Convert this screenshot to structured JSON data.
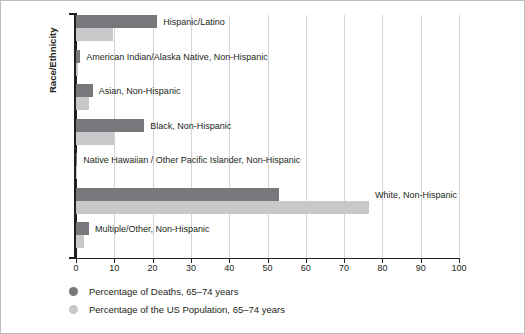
{
  "chart_data": {
    "type": "bar",
    "orientation": "horizontal",
    "title": "",
    "xlabel": "",
    "ylabel": "Race/Ethnicity",
    "xlim": [
      0,
      100
    ],
    "xticks": [
      0,
      10,
      20,
      30,
      40,
      50,
      60,
      70,
      80,
      90,
      100
    ],
    "xtick_labels": [
      "0",
      "10",
      "20",
      "30",
      "40",
      "50",
      "60",
      "70",
      "80",
      "90",
      "100"
    ],
    "grid": true,
    "grid_axis": "x",
    "legend_position": "bottom-left",
    "categories": [
      "Hispanic/Latino",
      "American Indian/Alaska Native, Non-Hispanic",
      "Asian, Non-Hispanic",
      "Black, Non-Hispanic",
      "Native Hawaiian / Other Pacific Islander, Non-Hispanic",
      "White, Non-Hispanic",
      "Multiple/Other, Non-Hispanic"
    ],
    "series": [
      {
        "name": "Percentage of Deaths, 65–74 years",
        "color": "#77787b",
        "values": [
          21.2,
          1.1,
          4.4,
          17.8,
          0.3,
          53.0,
          3.4
        ]
      },
      {
        "name": "Percentage of the US Population, 65–74 years",
        "color": "#c7c8ca",
        "values": [
          9.7,
          0.6,
          3.4,
          9.9,
          0.2,
          76.5,
          2.1
        ]
      }
    ]
  },
  "legend": {
    "items": [
      {
        "label": "Percentage of Deaths, 65–74 years",
        "color": "#77787b"
      },
      {
        "label": "Percentage of the US Population, 65–74 years",
        "color": "#c7c8ca"
      }
    ]
  },
  "axis": {
    "y_title": "Race/Ethnicity"
  }
}
